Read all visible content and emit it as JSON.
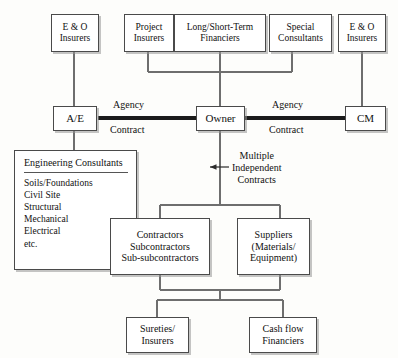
{
  "diagram": {
    "colors": {
      "background": "#fdfdfb",
      "box_fill": "#ffffff",
      "box_border": "#4a4a4a",
      "thin_line": "#6e6e6e",
      "thick_line": "#1b1b1b",
      "text": "#111111"
    },
    "nodes": {
      "eo_insurers_left": {
        "lines": [
          "E & O",
          "Insurers"
        ]
      },
      "project_insurers": {
        "lines": [
          "Project",
          "Insurers"
        ]
      },
      "financiers": {
        "lines": [
          "Long/Short-Term",
          "Financiers"
        ]
      },
      "special_consultants": {
        "lines": [
          "Special",
          "Consultants"
        ]
      },
      "eo_insurers_right": {
        "lines": [
          "E & O",
          "Insurers"
        ]
      },
      "ae": {
        "lines": [
          "A/E"
        ]
      },
      "owner": {
        "lines": [
          "Owner"
        ]
      },
      "cm": {
        "lines": [
          "CM"
        ]
      },
      "engineering_consultants": {
        "title": "Engineering Consultants",
        "items": [
          "Soils/Foundations",
          "Civil Site",
          "Structural",
          "Mechanical",
          "Electrical",
          "etc."
        ]
      },
      "contractors": {
        "lines": [
          "Contractors",
          "Subcontractors",
          "Sub-subcontractors"
        ]
      },
      "suppliers": {
        "lines": [
          "Suppliers",
          "(Materials/",
          "Equipment)"
        ]
      },
      "sureties": {
        "lines": [
          "Sureties/",
          "Insurers"
        ]
      },
      "cash_flow": {
        "lines": [
          "Cash flow",
          "Financiers"
        ]
      }
    },
    "edge_labels": {
      "agency_left": "Agency",
      "contract_left": "Contract",
      "agency_right": "Agency",
      "contract_right": "Contract"
    },
    "annotations": {
      "multiple_independent_contracts": [
        "Multiple",
        "Independent",
        "Contracts"
      ]
    }
  }
}
